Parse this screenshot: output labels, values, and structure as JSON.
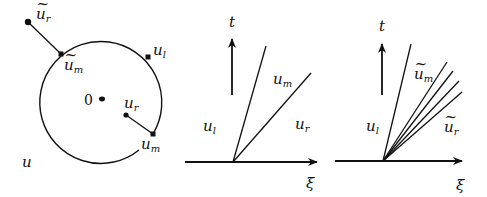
{
  "panel_phase": {
    "state_space_label": "u",
    "origin_label": "0",
    "points": [
      {
        "id": "ur_tilde",
        "base": "u",
        "tilde": true,
        "sub": "r"
      },
      {
        "id": "um_tilde",
        "base": "u",
        "tilde": true,
        "sub": "m"
      },
      {
        "id": "ul",
        "base": "u",
        "tilde": false,
        "sub": "l"
      },
      {
        "id": "ur",
        "base": "u",
        "tilde": false,
        "sub": "r"
      },
      {
        "id": "um",
        "base": "u",
        "tilde": false,
        "sub": "m"
      }
    ]
  },
  "panel_shock": {
    "t_label": "t",
    "xi_label": "ξ",
    "regions": {
      "left": {
        "base": "u",
        "sub": "l"
      },
      "middle": {
        "base": "u",
        "sub": "m"
      },
      "right": {
        "base": "u",
        "sub": "r"
      }
    }
  },
  "panel_fan": {
    "t_label": "t",
    "xi_label": "ξ",
    "regions": {
      "left": {
        "base": "u",
        "sub": "l"
      },
      "middle": {
        "base": "u",
        "tilde": true,
        "sub": "m"
      },
      "right": {
        "base": "u",
        "tilde": true,
        "sub": "r"
      }
    },
    "fan_rays": 4
  },
  "tilde_glyph": "~"
}
